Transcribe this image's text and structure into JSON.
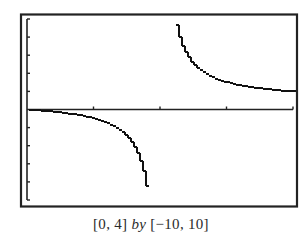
{
  "chart_data": {
    "type": "line",
    "title": "",
    "function_shape": "rational with vertical asymptote near x = 2 (approx. y = x/(x - 2))",
    "window": {
      "xmin": 0,
      "xmax": 4,
      "ymin": -10,
      "ymax": 10,
      "xscl": 1,
      "yscl": 2
    },
    "x_ticks": [
      1,
      2,
      3,
      4
    ],
    "y_ticks": [
      -10,
      -8,
      -6,
      -4,
      -2,
      2,
      4,
      6,
      8,
      10
    ],
    "grid": false,
    "legend": null,
    "series": [
      {
        "name": "left branch",
        "x": [
          0.0,
          0.25,
          0.5,
          0.75,
          1.0,
          1.25,
          1.5,
          1.6,
          1.7,
          1.8,
          1.85
        ],
        "y": [
          0.0,
          -0.14,
          -0.33,
          -0.6,
          -1.0,
          -1.67,
          -3.0,
          -4.0,
          -5.67,
          -9.0,
          -10.0
        ]
      },
      {
        "name": "right branch",
        "x": [
          2.2,
          2.25,
          2.4,
          2.6,
          2.8,
          3.0,
          3.25,
          3.5,
          3.75,
          4.0
        ],
        "y": [
          10.0,
          9.0,
          6.0,
          4.33,
          3.5,
          3.0,
          2.6,
          2.33,
          2.14,
          2.0
        ]
      }
    ],
    "caption": "[0, 4] by [−10, 10]"
  },
  "caption": {
    "xrange": "[0, 4]",
    "by": "by",
    "yrange": "[−10, 10]"
  },
  "colors": {
    "frame": "#222222",
    "curve": "#111111",
    "background": "#ffffff"
  }
}
